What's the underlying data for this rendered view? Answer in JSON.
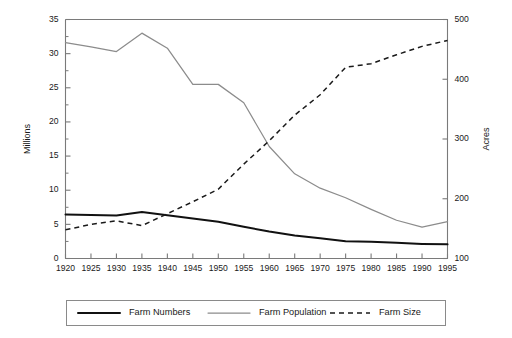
{
  "chart_data": {
    "type": "line",
    "title": "",
    "subtitle": "",
    "xlabel": "",
    "ylabel": "Millions",
    "y2label": "Acres",
    "xlim": [
      1920,
      1995
    ],
    "ylim": [
      0,
      35
    ],
    "y2lim": [
      100,
      500
    ],
    "grid": false,
    "legend_position": "bottom",
    "x": [
      1920,
      1925,
      1930,
      1935,
      1940,
      1945,
      1950,
      1955,
      1960,
      1965,
      1970,
      1975,
      1980,
      1985,
      1990,
      1995
    ],
    "xticklabels": [
      "1920",
      "1925",
      "1930",
      "1935",
      "1940",
      "1945",
      "1950",
      "1955",
      "1960",
      "1965",
      "1970",
      "1975",
      "1980",
      "1985",
      "1990",
      "1995"
    ],
    "yticklabels": [
      "0",
      "5",
      "10",
      "15",
      "20",
      "25",
      "30",
      "35"
    ],
    "ytickvalues": [
      0,
      5,
      10,
      15,
      20,
      25,
      30,
      35
    ],
    "y2ticklabels": [
      "100",
      "200",
      "300",
      "400",
      "500"
    ],
    "y2tickvalues": [
      100,
      200,
      300,
      400,
      500
    ],
    "series": [
      {
        "name": "Farm Numbers",
        "axis": "left",
        "units": "millions",
        "style": "solid-thick-black",
        "color": "#111111",
        "values": [
          6.45,
          6.37,
          6.29,
          6.81,
          6.35,
          5.86,
          5.39,
          4.65,
          3.96,
          3.36,
          2.95,
          2.52,
          2.44,
          2.29,
          2.14,
          2.07
        ]
      },
      {
        "name": "Farm Population",
        "axis": "left",
        "units": "millions",
        "style": "solid-thin-gray",
        "color": "#8c8c8c",
        "values": [
          31.6,
          31.0,
          30.3,
          33.0,
          30.8,
          25.5,
          25.5,
          22.8,
          16.4,
          12.4,
          10.3,
          8.9,
          7.2,
          5.6,
          4.6,
          5.4
        ]
      },
      {
        "name": "Farm Size",
        "axis": "right",
        "units": "acres",
        "style": "dashed-black",
        "color": "#1a1a1a",
        "values": [
          148,
          157,
          163,
          155,
          175,
          195,
          216,
          258,
          297,
          340,
          374,
          420,
          426,
          441,
          455,
          465
        ]
      }
    ],
    "legend": [
      {
        "label": "Farm Numbers",
        "style": "solid-thick-black",
        "color": "#111111"
      },
      {
        "label": "Farm Population",
        "style": "solid-thin-gray",
        "color": "#8c8c8c"
      },
      {
        "label": "Farm Size",
        "style": "dashed-black",
        "color": "#1a1a1a"
      }
    ]
  }
}
